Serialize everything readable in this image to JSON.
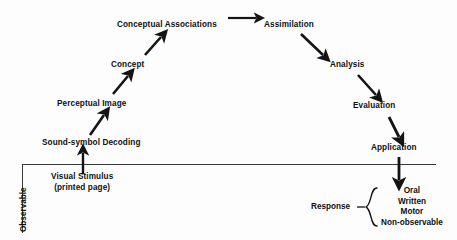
{
  "diagram": {
    "line_color": "#1a1a1a",
    "text_color": "#101010",
    "background": "#fdfdfd",
    "axis": {
      "observable_label": "Observable",
      "divider_name": "observable-boundary-line"
    },
    "nodes": [
      {
        "id": "visual-stimulus",
        "line1": "Visual Stimulus",
        "line2": "(printed page)",
        "x": 51,
        "y": 176
      },
      {
        "id": "sound-symbol-decoding",
        "label": "Sound-symbol Decoding",
        "x": 42,
        "y": 139
      },
      {
        "id": "perceptual-image",
        "label": "Perceptual Image",
        "x": 57,
        "y": 100
      },
      {
        "id": "concept",
        "label": "Concept",
        "x": 111,
        "y": 61
      },
      {
        "id": "conceptual-associations",
        "label": "Conceptual Associations",
        "x": 117,
        "y": 21
      },
      {
        "id": "assimilation",
        "label": "Assimilation",
        "x": 264,
        "y": 21
      },
      {
        "id": "analysis",
        "label": "Analysis",
        "x": 330,
        "y": 61
      },
      {
        "id": "evaluation",
        "label": "Evaluation",
        "x": 353,
        "y": 102
      },
      {
        "id": "application",
        "label": "Application",
        "x": 371,
        "y": 144
      }
    ],
    "response": {
      "label": "Response",
      "items": [
        "Oral",
        "Written",
        "Motor",
        "Non-observable"
      ]
    },
    "arrows": [
      {
        "from": "visual-stimulus",
        "to": "sound-symbol-decoding",
        "kind": "vertical-up"
      },
      {
        "from": "sound-symbol-decoding",
        "to": "perceptual-image",
        "kind": "diagonal-up-right"
      },
      {
        "from": "perceptual-image",
        "to": "concept",
        "kind": "diagonal-up-right"
      },
      {
        "from": "concept",
        "to": "conceptual-associations",
        "kind": "diagonal-up-right"
      },
      {
        "from": "conceptual-associations",
        "to": "assimilation",
        "kind": "horizontal-right"
      },
      {
        "from": "assimilation",
        "to": "analysis",
        "kind": "diagonal-down-right"
      },
      {
        "from": "analysis",
        "to": "evaluation",
        "kind": "diagonal-down-right"
      },
      {
        "from": "evaluation",
        "to": "application",
        "kind": "diagonal-down-right"
      },
      {
        "from": "application",
        "to": "response",
        "kind": "vertical-down"
      }
    ]
  }
}
